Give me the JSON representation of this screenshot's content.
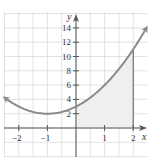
{
  "chart_data": {
    "type": "line",
    "title": "",
    "function": "y = x^2 + 2x + 3",
    "xlabel": "x",
    "ylabel": "y",
    "xlim": [
      -2.5,
      2.5
    ],
    "ylim": [
      -3,
      16
    ],
    "x_ticks": [
      -2,
      -1,
      1,
      2
    ],
    "x_tick_labels": [
      "−2",
      "−1",
      "1",
      "2"
    ],
    "y_ticks": [
      2,
      4,
      6,
      8,
      10,
      12,
      14
    ],
    "y_tick_labels": [
      "2",
      "4",
      "6",
      "8",
      "10",
      "12",
      "14"
    ],
    "grid": true,
    "grid_x_step": 0.5,
    "grid_y_step": 2,
    "series": [
      {
        "name": "parabola",
        "x": [
          -2.5,
          -2,
          -1.5,
          -1,
          -0.5,
          0,
          0.5,
          1,
          1.5,
          2,
          2.5
        ],
        "y": [
          4.25,
          3,
          2.25,
          2,
          2.25,
          3,
          4.25,
          6,
          8.25,
          11,
          14.25
        ],
        "color": "#8a8a8a",
        "arrows": "both"
      }
    ],
    "shaded_region": {
      "from_x": 0,
      "to_x": 2,
      "under": "parabola",
      "color": "#efefef"
    },
    "annotations": [
      {
        "type": "vertical-line",
        "x": 2,
        "from_y": 0,
        "to_y": 11
      }
    ],
    "vertex": {
      "x": -1,
      "y": 2
    }
  },
  "labels": {
    "x_axis": "x",
    "y_axis": "y",
    "x_ticks": [
      "−2",
      "−1",
      "1",
      "2"
    ],
    "y_ticks": [
      "2",
      "4",
      "6",
      "8",
      "10",
      "12",
      "14"
    ]
  },
  "colors": {
    "grid": "#d9d9d9",
    "axis": "#555555",
    "curve": "#8a8a8a",
    "shade": "#efefef"
  }
}
